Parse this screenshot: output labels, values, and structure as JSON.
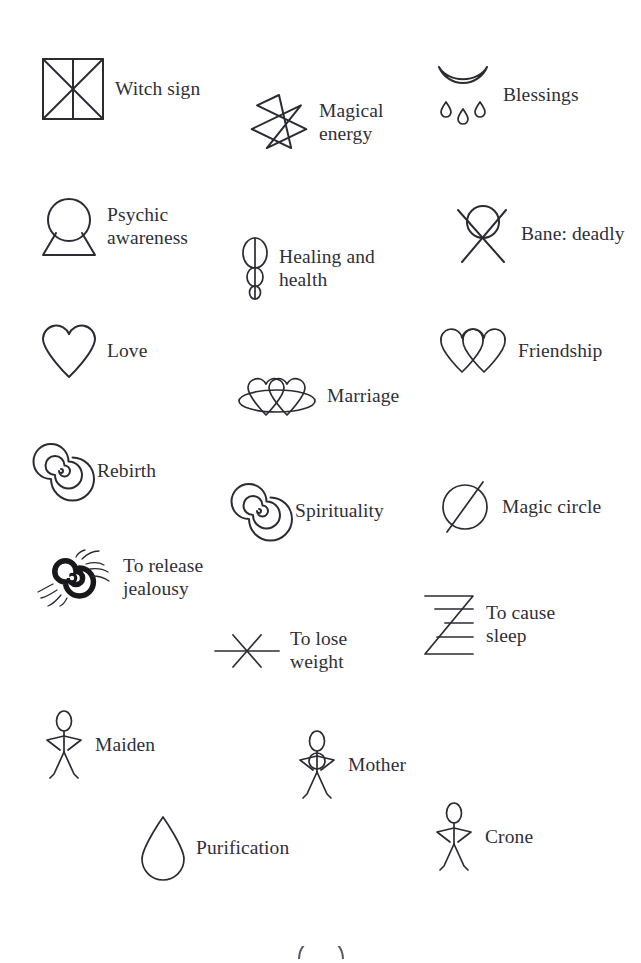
{
  "page": {
    "background_color": "#ffffff",
    "ink_color": "#2b2b33",
    "width": 641,
    "height": 956
  },
  "symbols": [
    {
      "id": "witch-sign",
      "label": "Witch sign",
      "icon": "square-with-cross-and-diagonals-icon",
      "x": 40,
      "y": 56,
      "label_lines": 1
    },
    {
      "id": "magical-energy",
      "label": "Magical\nenergy",
      "icon": "seven-pointed-star-icon",
      "x": 248,
      "y": 92,
      "label_lines": 2
    },
    {
      "id": "blessings",
      "label": "Blessings",
      "icon": "crescent-moon-with-drops-icon",
      "x": 432,
      "y": 62,
      "label_lines": 1
    },
    {
      "id": "psychic-awareness",
      "label": "Psychic\nawareness",
      "icon": "circle-on-trapezoid-icon",
      "x": 40,
      "y": 196,
      "label_lines": 2
    },
    {
      "id": "healing-and-health",
      "label": "Healing and\nhealth",
      "icon": "three-stacked-ovals-icon",
      "x": 240,
      "y": 236,
      "label_lines": 2
    },
    {
      "id": "bane-deadly",
      "label": "Bane: deadly",
      "icon": "circle-with-x-icon",
      "x": 452,
      "y": 202,
      "label_lines": 1
    },
    {
      "id": "love",
      "label": "Love",
      "icon": "heart-icon",
      "x": 40,
      "y": 322,
      "label_lines": 1
    },
    {
      "id": "friendship",
      "label": "Friendship",
      "icon": "two-overlapping-hearts-icon",
      "x": 437,
      "y": 328,
      "label_lines": 1
    },
    {
      "id": "marriage",
      "label": "Marriage",
      "icon": "two-hearts-in-ellipse-icon",
      "x": 236,
      "y": 374,
      "label_lines": 1
    },
    {
      "id": "rebirth",
      "label": "Rebirth",
      "icon": "spiral-icon",
      "x": 34,
      "y": 444,
      "label_lines": 1
    },
    {
      "id": "spirituality",
      "label": "Spirituality",
      "icon": "spiral-icon",
      "x": 232,
      "y": 484,
      "label_lines": 1
    },
    {
      "id": "magic-circle",
      "label": "Magic circle",
      "icon": "circle-with-slash-icon",
      "x": 437,
      "y": 478,
      "label_lines": 1
    },
    {
      "id": "to-release-jealousy",
      "label": "To release\njealousy",
      "icon": "dense-spiral-with-rays-icon",
      "x": 38,
      "y": 550,
      "label_lines": 2
    },
    {
      "id": "to-cause-sleep",
      "label": "To cause\nsleep",
      "icon": "z-with-lines-icon",
      "x": 421,
      "y": 592,
      "label_lines": 2
    },
    {
      "id": "to-lose-weight",
      "label": "To lose\nweight",
      "icon": "line-with-x-icon",
      "x": 213,
      "y": 628,
      "label_lines": 2
    },
    {
      "id": "maiden",
      "label": "Maiden",
      "icon": "stick-figure-hands-on-hips-icon",
      "x": 42,
      "y": 710,
      "label_lines": 1
    },
    {
      "id": "mother",
      "label": "Mother",
      "icon": "stick-figure-hands-on-hips-icon",
      "x": 295,
      "y": 730,
      "label_lines": 1
    },
    {
      "id": "purification",
      "label": "Purification",
      "icon": "water-drop-icon",
      "x": 139,
      "y": 814,
      "label_lines": 1
    },
    {
      "id": "crone",
      "label": "Crone",
      "icon": "stick-figure-hands-on-hips-icon",
      "x": 432,
      "y": 802,
      "label_lines": 1
    }
  ],
  "bottom_partial": {
    "id": "cut-off-shape",
    "icon": "partial-arc-icon",
    "description": "partially visible arc at bottom edge"
  }
}
